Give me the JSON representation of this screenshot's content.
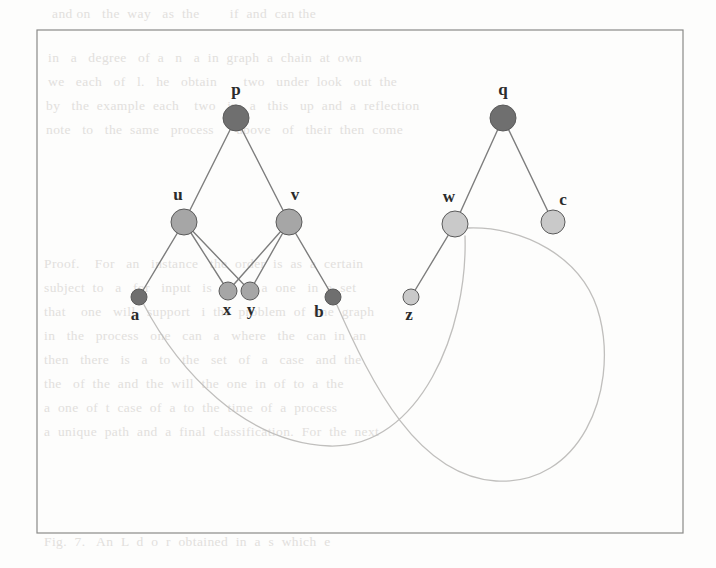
{
  "figure": {
    "kind": "graph-diagram",
    "background_color": "#fdfdfc",
    "frame": {
      "name": "figure-border",
      "x": 37,
      "y": 30,
      "width": 646,
      "height": 503,
      "stroke": "#8a8a88",
      "stroke_width": 1.2
    },
    "palette": {
      "node_dark": "#6f6f6f",
      "node_medium": "#a6a6a6",
      "node_light": "#c9c9c9",
      "node_stroke": "#5a5a5a",
      "edge_straight": "#7d7d7d",
      "edge_curved": "#c0bfbd",
      "label": "#2b2b2b"
    },
    "nodes": [
      {
        "id": "p",
        "label": "p",
        "x": 236,
        "y": 118,
        "r": 13,
        "shade": "dark",
        "label_dx": 0,
        "label_dy": -27
      },
      {
        "id": "u",
        "label": "u",
        "x": 184,
        "y": 222,
        "r": 13,
        "shade": "medium",
        "label_dx": -6,
        "label_dy": -26
      },
      {
        "id": "v",
        "label": "v",
        "x": 289,
        "y": 222,
        "r": 13,
        "shade": "medium",
        "label_dx": 6,
        "label_dy": -26
      },
      {
        "id": "a",
        "label": "a",
        "x": 139,
        "y": 297,
        "r": 8,
        "shade": "dark",
        "label_dx": -4,
        "label_dy": 19
      },
      {
        "id": "x",
        "label": "x",
        "x": 228,
        "y": 291,
        "r": 9,
        "shade": "medium",
        "label_dx": -1,
        "label_dy": 20
      },
      {
        "id": "y",
        "label": "y",
        "x": 250,
        "y": 291,
        "r": 9,
        "shade": "medium",
        "label_dx": 1,
        "label_dy": 20
      },
      {
        "id": "b",
        "label": "b",
        "x": 333,
        "y": 297,
        "r": 8,
        "shade": "dark",
        "label_dx": -14,
        "label_dy": 16
      },
      {
        "id": "q",
        "label": "q",
        "x": 503,
        "y": 118,
        "r": 13,
        "shade": "dark",
        "label_dx": 0,
        "label_dy": -27
      },
      {
        "id": "w",
        "label": "w",
        "x": 455,
        "y": 224,
        "r": 13,
        "shade": "light",
        "label_dx": -6,
        "label_dy": -26
      },
      {
        "id": "c",
        "label": "c",
        "x": 553,
        "y": 222,
        "r": 12,
        "shade": "light",
        "label_dx": 10,
        "label_dy": -21
      },
      {
        "id": "z",
        "label": "z",
        "x": 411,
        "y": 297,
        "r": 8,
        "shade": "light",
        "label_dx": -2,
        "label_dy": 19
      }
    ],
    "straight_edges": [
      {
        "from": "p",
        "to": "u"
      },
      {
        "from": "p",
        "to": "v"
      },
      {
        "from": "u",
        "to": "a"
      },
      {
        "from": "u",
        "to": "x"
      },
      {
        "from": "u",
        "to": "y"
      },
      {
        "from": "v",
        "to": "x"
      },
      {
        "from": "v",
        "to": "y"
      },
      {
        "from": "v",
        "to": "b"
      },
      {
        "from": "q",
        "to": "w"
      },
      {
        "from": "q",
        "to": "c"
      },
      {
        "from": "w",
        "to": "z"
      }
    ],
    "curved_edges": [
      {
        "name": "edge-a-w",
        "from": "a",
        "to": "w",
        "path": "M 143 303 C 178 370 244 443 330 446 C 420 448 468 330 465 236"
      },
      {
        "name": "edge-b-w",
        "from": "b",
        "to": "w",
        "path": "M 336 303 C 372 385 418 476 496 481 C 580 486 618 392 600 318 C 585 255 520 226 468 228"
      }
    ],
    "labels_visible": [
      "p",
      "u",
      "v",
      "a",
      "x",
      "y",
      "b",
      "q",
      "w",
      "c",
      "z"
    ]
  },
  "page": {
    "bleed_lines": [
      {
        "x": 52,
        "y": 18,
        "text": "and on   the  way   as  the        if  and  can the"
      },
      {
        "x": 48,
        "y": 62,
        "text": "in   a   degree   of  a   n   a  in  graph  a  chain  at  own"
      },
      {
        "x": 48,
        "y": 86,
        "text": "we   each   of   l.   he   obtain       two   under  look   out  the"
      },
      {
        "x": 46,
        "y": 110,
        "text": "by   the  example  each    two   in   a   this   up  and  a  reflection"
      },
      {
        "x": 46,
        "y": 134,
        "text": "note   to   the  same   process      above   of   their  then  come"
      },
      {
        "x": 48,
        "y": 200,
        "text": ""
      },
      {
        "x": 44,
        "y": 268,
        "text": "Proof.    For   an   instance   the  order  is  as  a  certain"
      },
      {
        "x": 44,
        "y": 292,
        "text": "subject  to   a   for   input   is  m,  or  a  one   in  a  set"
      },
      {
        "x": 44,
        "y": 316,
        "text": "that    one   will   support   i  the  problem  of  one  graph"
      },
      {
        "x": 44,
        "y": 340,
        "text": "in   the   process   one   can   a   where   the   can  in  an"
      },
      {
        "x": 44,
        "y": 364,
        "text": "then   there   is   a   to   the   set   of   a   case   and  the"
      },
      {
        "x": 44,
        "y": 388,
        "text": "the   of  the  and  the  will  the  one  in  of  to  a  the"
      },
      {
        "x": 44,
        "y": 412,
        "text": "a  one  of  t  case  of  a  to  the  time  of  a  process"
      },
      {
        "x": 44,
        "y": 436,
        "text": "a  unique  path  and  a  final  classification.  For  the  next"
      },
      {
        "x": 44,
        "y": 546,
        "text": "Fig.  7.   An  L  d  o  r  obtained  in  a  s  which  e"
      }
    ]
  }
}
